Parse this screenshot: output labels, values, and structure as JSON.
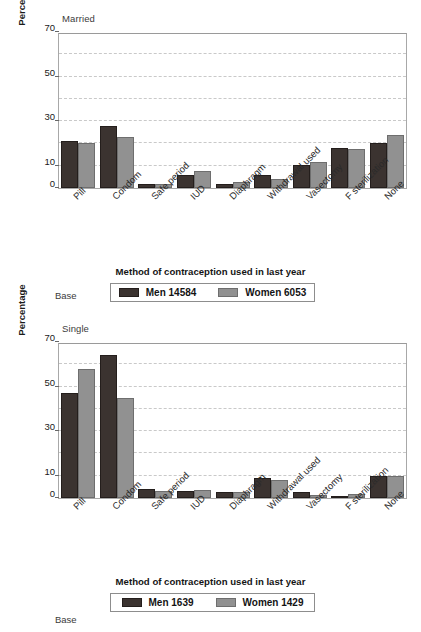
{
  "figure": {
    "panels": [
      {
        "key": "married",
        "title": "Married",
        "base_label": "Base",
        "xaxis_title": "Method of contraception used in last year",
        "ylabel": "Percentage",
        "legend": [
          {
            "name": "Men 14584",
            "color": "#3b3330"
          },
          {
            "name": "Women 6053",
            "color": "#919191"
          }
        ]
      },
      {
        "key": "single",
        "title": "Single",
        "base_label": "Base",
        "xaxis_title": "Method of contraception used in last year",
        "ylabel": "Percentage",
        "legend": [
          {
            "name": "Men 1639",
            "color": "#3b3330"
          },
          {
            "name": "Women 1429",
            "color": "#919191"
          }
        ]
      }
    ]
  },
  "chart_data": [
    {
      "type": "bar",
      "title": "Married",
      "xlabel": "Method of contraception used in last year",
      "ylabel": "Percentage",
      "ylim": [
        0,
        70
      ],
      "yticks": [
        0,
        10,
        30,
        50,
        70
      ],
      "gridlines": [
        20,
        40,
        60
      ],
      "grid": true,
      "legend_position": "below",
      "categories": [
        "Pill",
        "Condom",
        "Safe period",
        "IUD",
        "Diaphragm",
        "Withdrawal used",
        "Vasectomy",
        "F sterilization",
        "None"
      ],
      "series": [
        {
          "name": "Men 14584",
          "color": "#3b3330",
          "values": [
            21,
            28,
            2,
            6,
            2,
            6,
            10.5,
            18,
            20
          ]
        },
        {
          "name": "Women 6053",
          "color": "#919191",
          "values": [
            20,
            23,
            2,
            7.5,
            2.5,
            4,
            11.5,
            17.5,
            24
          ]
        }
      ]
    },
    {
      "type": "bar",
      "title": "Single",
      "xlabel": "Method of contraception used in last year",
      "ylabel": "Percentage",
      "ylim": [
        0,
        70
      ],
      "yticks": [
        0,
        10,
        30,
        50,
        70
      ],
      "gridlines": [
        20,
        40,
        60
      ],
      "grid": true,
      "legend_position": "below",
      "categories": [
        "Pill",
        "Condom",
        "Safe period",
        "IUD",
        "Diaphragm",
        "Withdrawal used",
        "Vasectomy",
        "F sterilization",
        "None"
      ],
      "series": [
        {
          "name": "Men 1639",
          "color": "#3b3330",
          "values": [
            47,
            64,
            4,
            3,
            2.5,
            9,
            2.5,
            1,
            10
          ]
        },
        {
          "name": "Women 1429",
          "color": "#919191",
          "values": [
            58,
            45,
            3,
            3.5,
            2.5,
            8,
            1.5,
            2,
            10
          ]
        }
      ]
    }
  ]
}
